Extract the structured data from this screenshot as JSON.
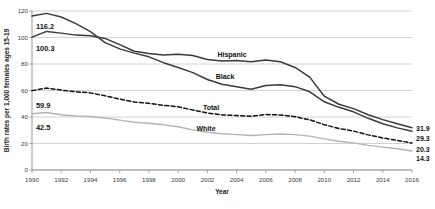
{
  "chart_data": {
    "type": "line",
    "title": "",
    "xlabel": "Year",
    "ylabel": "Birth rates per 1,000 females ages 15-19",
    "xlim": [
      1990,
      2016
    ],
    "ylim": [
      0,
      120
    ],
    "grid": true,
    "legend_position": "inline-annotations",
    "x": [
      1990,
      1991,
      1992,
      1993,
      1994,
      1995,
      1996,
      1997,
      1998,
      1999,
      2000,
      2001,
      2002,
      2003,
      2004,
      2005,
      2006,
      2007,
      2008,
      2009,
      2010,
      2011,
      2012,
      2013,
      2014,
      2015,
      2016
    ],
    "xticks": [
      1990,
      1992,
      1994,
      1996,
      1998,
      2000,
      2002,
      2004,
      2006,
      2008,
      2010,
      2012,
      2014,
      2016
    ],
    "xtick_labels": [
      "1990",
      "1992",
      "1994",
      "1996",
      "1998",
      "2000",
      "2002",
      "2004",
      "2006",
      "2008",
      "2010",
      "2012",
      "2014",
      "2016"
    ],
    "yticks": [
      0,
      20,
      40,
      60,
      80,
      100,
      120
    ],
    "ytick_labels": [
      "0",
      "20",
      "40",
      "60",
      "80",
      "100",
      "120"
    ],
    "series": [
      {
        "name": "Black",
        "label": "Black",
        "color": "#3a3a3a",
        "style": "solid",
        "width": 1.5,
        "start_value": 116.2,
        "end_value": 29.3,
        "values": [
          116.2,
          118.2,
          115.5,
          110.5,
          104.5,
          96.1,
          91.4,
          88.2,
          85.4,
          81.0,
          77.4,
          73.5,
          68.3,
          64.7,
          62.9,
          60.9,
          63.7,
          64.3,
          62.9,
          59.0,
          51.5,
          47.3,
          43.9,
          39.0,
          34.9,
          31.8,
          29.3
        ]
      },
      {
        "name": "Hispanic",
        "label": "Hispanic",
        "color": "#3a3a3a",
        "style": "solid",
        "width": 1.5,
        "start_value": 100.3,
        "end_value": 31.9,
        "values": [
          100.3,
          104.6,
          103.3,
          101.8,
          101.3,
          99.3,
          94.6,
          89.6,
          87.9,
          86.8,
          87.3,
          86.4,
          83.4,
          82.2,
          82.6,
          81.7,
          83.0,
          81.7,
          77.4,
          70.1,
          55.7,
          49.6,
          46.3,
          41.7,
          38.0,
          34.9,
          31.9
        ]
      },
      {
        "name": "Total",
        "label": "Total",
        "color": "#111111",
        "style": "dashed",
        "width": 1.5,
        "start_value": 59.9,
        "end_value": 20.3,
        "values": [
          59.9,
          61.8,
          60.3,
          59.0,
          58.2,
          56.0,
          53.5,
          51.3,
          50.3,
          48.8,
          47.7,
          45.3,
          43.0,
          41.6,
          41.1,
          40.5,
          41.9,
          41.5,
          40.2,
          37.9,
          34.2,
          31.3,
          29.4,
          26.5,
          24.2,
          22.3,
          20.3
        ]
      },
      {
        "name": "White",
        "label": "White",
        "color": "#b3b3b3",
        "style": "solid",
        "width": 1.4,
        "start_value": 42.5,
        "end_value": 14.3,
        "values": [
          42.5,
          43.4,
          41.7,
          40.7,
          40.4,
          39.3,
          37.6,
          36.0,
          35.3,
          34.1,
          32.6,
          30.3,
          28.5,
          27.4,
          26.7,
          26.0,
          26.7,
          27.2,
          26.7,
          25.6,
          23.5,
          21.7,
          20.5,
          18.6,
          17.3,
          16.0,
          14.3
        ]
      }
    ],
    "annotations": [
      {
        "text": "116.2",
        "series": "Black",
        "kind": "start-value"
      },
      {
        "text": "100.3",
        "series": "Hispanic",
        "kind": "start-value"
      },
      {
        "text": "59.9",
        "series": "Total",
        "kind": "start-value"
      },
      {
        "text": "42.5",
        "series": "White",
        "kind": "start-value"
      },
      {
        "text": "31.9",
        "series": "Hispanic",
        "kind": "end-value"
      },
      {
        "text": "29.3",
        "series": "Black",
        "kind": "end-value"
      },
      {
        "text": "20.3",
        "series": "Total",
        "kind": "end-value"
      },
      {
        "text": "14.3",
        "series": "White",
        "kind": "end-value"
      }
    ]
  }
}
